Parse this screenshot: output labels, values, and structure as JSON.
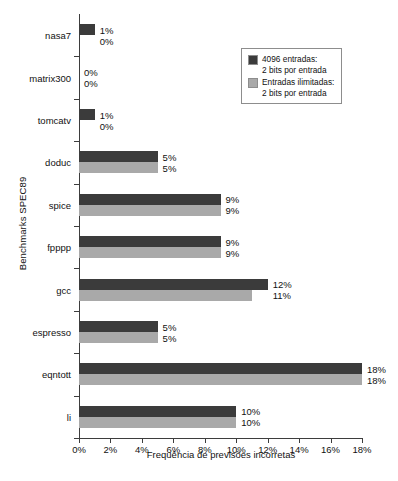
{
  "chart_data": {
    "type": "bar",
    "orientation": "horizontal",
    "title": "",
    "xlabel": "Frequência de previsões incorretas",
    "ylabel": "Benchmarks SPEC89",
    "categories": [
      "nasa7",
      "matrix300",
      "tomcatv",
      "doduc",
      "spice",
      "fpppp",
      "gcc",
      "espresso",
      "eqntott",
      "li"
    ],
    "series": [
      {
        "name": "4096 entradas: 2 bits por entrada",
        "color": "#3b3b3b",
        "values": [
          1,
          0,
          1,
          5,
          9,
          9,
          12,
          5,
          18,
          10
        ],
        "labels": [
          "1%",
          "0%",
          "1%",
          "5%",
          "9%",
          "9%",
          "12%",
          "5%",
          "18%",
          "10%"
        ]
      },
      {
        "name": "Entradas ilimitadas: 2 bits por entrada",
        "color": "#a9a9a9",
        "values": [
          0,
          0,
          0,
          5,
          9,
          9,
          11,
          5,
          18,
          10
        ],
        "labels": [
          "0%",
          "0%",
          "0%",
          "5%",
          "9%",
          "9%",
          "11%",
          "5%",
          "18%",
          "10%"
        ]
      }
    ],
    "xlim": [
      0,
      18
    ],
    "xticks": [
      0,
      2,
      4,
      6,
      8,
      10,
      12,
      14,
      16,
      18
    ],
    "xtick_labels": [
      "0%",
      "2%",
      "4%",
      "6%",
      "8%",
      "10%",
      "12%",
      "14%",
      "16%",
      "18%"
    ],
    "grid": false,
    "legend_position": "top-right"
  },
  "legend": {
    "items": [
      {
        "swatch": "dark",
        "line1": "4096 entradas:",
        "line2": "2 bits por entrada"
      },
      {
        "swatch": "light",
        "line1": "Entradas ilimitadas:",
        "line2": "2 bits por entrada"
      }
    ]
  },
  "caption": {
    "text": ""
  }
}
